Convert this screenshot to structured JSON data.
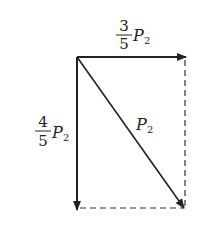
{
  "diagram": {
    "type": "vector-decomposition",
    "colors": {
      "stroke": "#222222",
      "dashed": "#333333",
      "background": "#ffffff"
    },
    "vectors": [
      {
        "name": "horizontal-component",
        "label": {
          "num": "3",
          "den": "5",
          "var": "P",
          "sub": "2"
        }
      },
      {
        "name": "vertical-component",
        "label": {
          "num": "4",
          "den": "5",
          "var": "P",
          "sub": "2"
        }
      },
      {
        "name": "resultant",
        "label": {
          "var": "P",
          "sub": "2"
        }
      }
    ]
  }
}
